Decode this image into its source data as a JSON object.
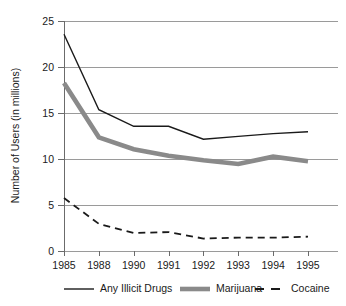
{
  "chart_data": {
    "type": "line",
    "title": "",
    "xlabel": "",
    "ylabel": "Number of Users (in millions)",
    "categories": [
      "1985",
      "1988",
      "1990",
      "1991",
      "1992",
      "1993",
      "1994",
      "1995"
    ],
    "ylim": [
      0,
      25
    ],
    "yticks": [
      0,
      5,
      10,
      15,
      20,
      25
    ],
    "ytick_labels": [
      "0",
      "5",
      "10",
      "15",
      "20",
      "25"
    ],
    "grid": "horizontal",
    "legend_position": "bottom",
    "series": [
      {
        "name": "Any Illicit Drugs",
        "style": "solid-thin",
        "color": "#1a1a1a",
        "values": [
          23.5,
          15.3,
          13.5,
          13.5,
          12.1,
          12.4,
          12.7,
          12.9
        ]
      },
      {
        "name": "Marijuana",
        "style": "solid-thick",
        "color": "#8a8a8a",
        "values": [
          18.2,
          12.3,
          11.0,
          10.3,
          9.8,
          9.4,
          10.2,
          9.7
        ]
      },
      {
        "name": "Cocaine",
        "style": "dashed",
        "color": "#1a1a1a",
        "values": [
          5.7,
          2.9,
          1.9,
          2.0,
          1.3,
          1.4,
          1.4,
          1.5
        ]
      }
    ]
  },
  "legend": {
    "items": [
      {
        "label": "Any Illicit Drugs"
      },
      {
        "label": "Marijuana"
      },
      {
        "label": "Cocaine"
      }
    ]
  },
  "axes": {
    "y_axis_title": "Number of Users (in millions)"
  }
}
